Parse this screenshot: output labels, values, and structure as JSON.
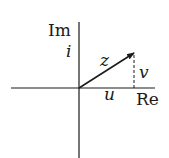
{
  "diagram": {
    "title": "",
    "axes": {
      "real_label": "Re",
      "imag_label": "Im",
      "imag_unit_label": "i"
    },
    "vector": {
      "label": "z",
      "from": "origin",
      "direction": "first-quadrant"
    },
    "components": {
      "real_part_label": "u",
      "imag_part_label": "v",
      "imag_part_style": "dashed"
    },
    "colors": {
      "ink": "#1a1a1a",
      "background": "#ffffff"
    }
  }
}
